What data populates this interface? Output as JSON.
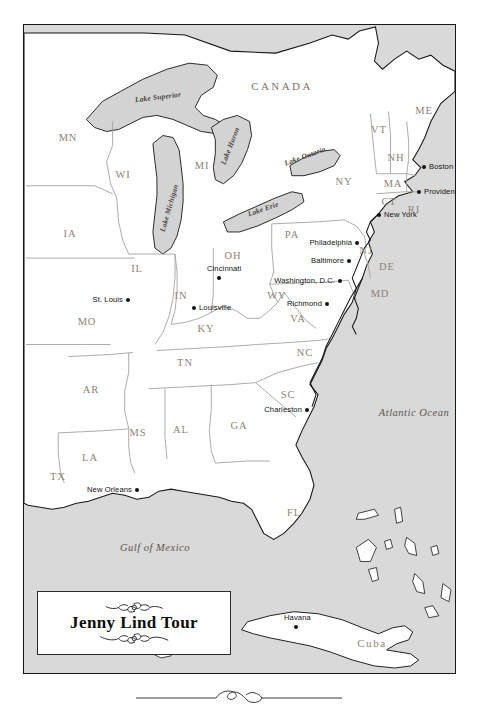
{
  "title_cartouche": {
    "title": "Jenny Lind Tour",
    "ornament_top": "scroll-ornament",
    "ornament_bottom": "scroll-ornament"
  },
  "footer": {
    "ornament": "swash-rule-ornament"
  },
  "map": {
    "projection_note": "Eastern United States, Great Lakes, Gulf of Mexico and Cuba",
    "colors": {
      "land": "#ffffff",
      "water": "#d8d8d8",
      "border": "#171717",
      "state_line": "#9a9a9a",
      "state_label": "#8e8277",
      "city_dot": "#111111",
      "frame": "#171717"
    },
    "countries": [
      {
        "name": "CANADA",
        "x": 258,
        "y": 61
      }
    ],
    "islands": [
      {
        "name": "Cuba",
        "x": 348,
        "y": 618
      }
    ],
    "oceans": [
      {
        "name": "Atlantic Ocean",
        "x": 390,
        "y": 387
      },
      {
        "name": "Gulf of Mexico",
        "x": 131,
        "y": 522
      }
    ],
    "lakes": [
      {
        "name": "Lake Superior",
        "x": 134,
        "y": 72,
        "rot": -7
      },
      {
        "name": "Lake Michigan",
        "x": 145,
        "y": 183,
        "rot": -74
      },
      {
        "name": "Lake Huron",
        "x": 206,
        "y": 121,
        "rot": -69
      },
      {
        "name": "Lake Erie",
        "x": 239,
        "y": 184,
        "rot": -19
      },
      {
        "name": "Lake Ontario",
        "x": 281,
        "y": 131,
        "rot": -20
      }
    ],
    "states": [
      {
        "abbr": "MN",
        "x": 44,
        "y": 112
      },
      {
        "abbr": "WI",
        "x": 99,
        "y": 149
      },
      {
        "abbr": "MI",
        "x": 178,
        "y": 140
      },
      {
        "abbr": "IA",
        "x": 46,
        "y": 208
      },
      {
        "abbr": "IL",
        "x": 113,
        "y": 243
      },
      {
        "abbr": "IN",
        "x": 157,
        "y": 270
      },
      {
        "abbr": "OH",
        "x": 209,
        "y": 230
      },
      {
        "abbr": "PA",
        "x": 268,
        "y": 209
      },
      {
        "abbr": "NY",
        "x": 320,
        "y": 156
      },
      {
        "abbr": "VT",
        "x": 355,
        "y": 104
      },
      {
        "abbr": "NH",
        "x": 372,
        "y": 132
      },
      {
        "abbr": "ME",
        "x": 400,
        "y": 85
      },
      {
        "abbr": "MA",
        "x": 369,
        "y": 158
      },
      {
        "abbr": "CT",
        "x": 365,
        "y": 176
      },
      {
        "abbr": "RI",
        "x": 390,
        "y": 184
      },
      {
        "abbr": "NJ",
        "x": 342,
        "y": 225
      },
      {
        "abbr": "DE",
        "x": 363,
        "y": 241
      },
      {
        "abbr": "MD",
        "x": 356,
        "y": 268
      },
      {
        "abbr": "WV",
        "x": 253,
        "y": 270
      },
      {
        "abbr": "VA",
        "x": 274,
        "y": 293
      },
      {
        "abbr": "MO",
        "x": 63,
        "y": 296
      },
      {
        "abbr": "KY",
        "x": 182,
        "y": 303
      },
      {
        "abbr": "TN",
        "x": 161,
        "y": 337
      },
      {
        "abbr": "NC",
        "x": 281,
        "y": 327
      },
      {
        "abbr": "AR",
        "x": 67,
        "y": 364
      },
      {
        "abbr": "MS",
        "x": 114,
        "y": 407
      },
      {
        "abbr": "AL",
        "x": 157,
        "y": 404
      },
      {
        "abbr": "GA",
        "x": 215,
        "y": 400
      },
      {
        "abbr": "SC",
        "x": 264,
        "y": 369
      },
      {
        "abbr": "LA",
        "x": 66,
        "y": 432
      },
      {
        "abbr": "TX",
        "x": 34,
        "y": 451
      },
      {
        "abbr": "FL",
        "x": 270,
        "y": 487
      }
    ],
    "cities": [
      {
        "name": "Boston",
        "x": 400,
        "y": 142,
        "side": "right"
      },
      {
        "name": "Providence",
        "x": 395,
        "y": 167,
        "side": "right"
      },
      {
        "name": "New York",
        "x": 355,
        "y": 190,
        "side": "right"
      },
      {
        "name": "Philadelphia",
        "x": 333,
        "y": 218,
        "side": "left"
      },
      {
        "name": "Baltimore",
        "x": 325,
        "y": 236,
        "side": "left"
      },
      {
        "name": "Washington, D.C.",
        "x": 316,
        "y": 256,
        "side": "left"
      },
      {
        "name": "Richmond",
        "x": 303,
        "y": 279,
        "side": "left"
      },
      {
        "name": "Cincinnati",
        "x": 195,
        "y": 253,
        "side": "above"
      },
      {
        "name": "Louisville",
        "x": 170,
        "y": 283,
        "side": "right"
      },
      {
        "name": "St. Louis",
        "x": 104,
        "y": 275,
        "side": "left"
      },
      {
        "name": "Charleston",
        "x": 283,
        "y": 385,
        "side": "left"
      },
      {
        "name": "New Orleans",
        "x": 113,
        "y": 465,
        "side": "left"
      },
      {
        "name": "Havana",
        "x": 272,
        "y": 602,
        "side": "above"
      }
    ]
  }
}
